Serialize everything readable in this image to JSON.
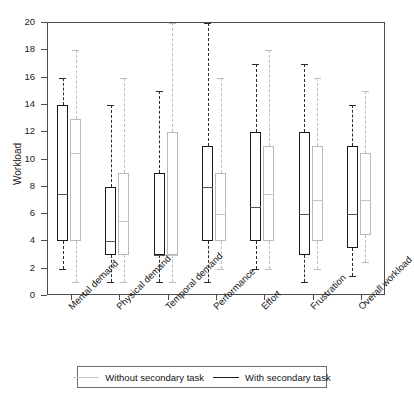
{
  "chart_data": {
    "type": "box",
    "title": "",
    "xlabel": "",
    "ylabel": "Workload",
    "ylim": [
      0,
      20
    ],
    "yticks": [
      0,
      2,
      4,
      6,
      8,
      10,
      12,
      14,
      16,
      18,
      20
    ],
    "grid": false,
    "legend_position": "bottom",
    "categories": [
      "Mental demand",
      "Physical demand",
      "Temporal demand",
      "Performance",
      "Effort",
      "Frustration",
      "Overall workload"
    ],
    "series": [
      {
        "name": "With secondary task",
        "color": "#1a1a1a",
        "boxes": [
          {
            "category": "Mental demand",
            "whisker_low": 2.0,
            "q1": 4.0,
            "median": 7.5,
            "q3": 14.0,
            "whisker_high": 16.0
          },
          {
            "category": "Physical demand",
            "whisker_low": 1.0,
            "q1": 3.0,
            "median": 4.0,
            "q3": 8.0,
            "whisker_high": 14.0
          },
          {
            "category": "Temporal demand",
            "whisker_low": 1.0,
            "q1": 3.0,
            "median": 3.0,
            "q3": 9.0,
            "whisker_high": 15.0
          },
          {
            "category": "Performance",
            "whisker_low": 1.0,
            "q1": 4.0,
            "median": 8.0,
            "q3": 11.0,
            "whisker_high": 20.0
          },
          {
            "category": "Effort",
            "whisker_low": 2.0,
            "q1": 4.0,
            "median": 6.5,
            "q3": 12.0,
            "whisker_high": 17.0
          },
          {
            "category": "Frustration",
            "whisker_low": 1.0,
            "q1": 3.0,
            "median": 6.0,
            "q3": 12.0,
            "whisker_high": 17.0
          },
          {
            "category": "Overall workload",
            "whisker_low": 1.5,
            "q1": 3.5,
            "median": 6.0,
            "q3": 11.0,
            "whisker_high": 14.0
          }
        ]
      },
      {
        "name": "Without secondary task",
        "color": "#c0c0c0",
        "boxes": [
          {
            "category": "Mental demand",
            "whisker_low": 1.0,
            "q1": 4.0,
            "median": 10.5,
            "q3": 13.0,
            "whisker_high": 18.0
          },
          {
            "category": "Physical demand",
            "whisker_low": 1.0,
            "q1": 3.0,
            "median": 5.5,
            "q3": 9.0,
            "whisker_high": 16.0
          },
          {
            "category": "Temporal demand",
            "whisker_low": 1.0,
            "q1": 3.0,
            "median": 3.0,
            "q3": 12.0,
            "whisker_high": 20.0
          },
          {
            "category": "Performance",
            "whisker_low": 2.0,
            "q1": 4.0,
            "median": 6.0,
            "q3": 9.0,
            "whisker_high": 16.0
          },
          {
            "category": "Effort",
            "whisker_low": 2.0,
            "q1": 4.0,
            "median": 7.5,
            "q3": 11.0,
            "whisker_high": 18.0
          },
          {
            "category": "Frustration",
            "whisker_low": 2.0,
            "q1": 4.0,
            "median": 7.0,
            "q3": 11.0,
            "whisker_high": 16.0
          },
          {
            "category": "Overall workload",
            "whisker_low": 2.5,
            "q1": 4.5,
            "median": 7.0,
            "q3": 10.5,
            "whisker_high": 15.0
          }
        ]
      }
    ]
  },
  "legend": {
    "items": [
      {
        "label": "Without secondary task",
        "swatch": "light"
      },
      {
        "label": "With secondary task",
        "swatch": "dark"
      }
    ]
  }
}
